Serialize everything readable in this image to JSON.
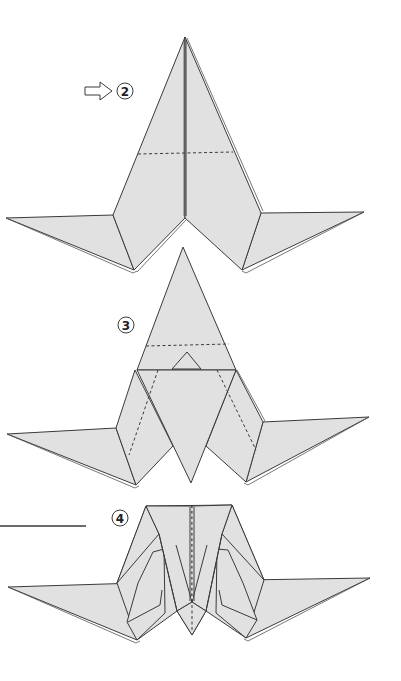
{
  "diagram": {
    "type": "origami-instructions",
    "steps": [
      {
        "number": "2",
        "label": "②",
        "has_turn_over_arrow": true,
        "marks": [
          "valley-fold dashed line horizontal across body"
        ]
      },
      {
        "number": "3",
        "label": "③",
        "marks": [
          "valley-fold dashed horizontal line",
          "two diagonal dashed fold lines",
          "small triangle flap at center"
        ]
      },
      {
        "number": "4",
        "label": "④",
        "marks": [
          "center vertical dashed line"
        ]
      }
    ],
    "colors": {
      "paper": "#e1e1e1",
      "line": "#3a3a3a",
      "background": "#ffffff"
    }
  }
}
